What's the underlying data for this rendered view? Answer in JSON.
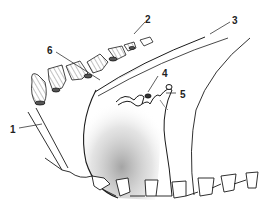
{
  "figure": {
    "type": "anatomical line drawing",
    "background": "#ffffff",
    "stroke_color": "#1a1a1a",
    "shade_color": "#8c8c8c",
    "labels": [
      {
        "id": "1",
        "text": "1",
        "x": 10,
        "y": 125
      },
      {
        "id": "2",
        "text": "2",
        "x": 145,
        "y": 15
      },
      {
        "id": "3",
        "text": "3",
        "x": 232,
        "y": 16
      },
      {
        "id": "4",
        "text": "4",
        "x": 162,
        "y": 69
      },
      {
        "id": "5",
        "text": "5",
        "x": 180,
        "y": 90
      },
      {
        "id": "6",
        "text": "6",
        "x": 47,
        "y": 46
      }
    ]
  }
}
